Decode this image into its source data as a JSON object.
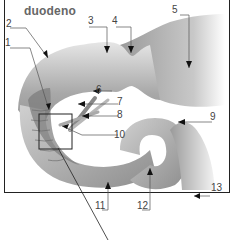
{
  "title": "duodeno",
  "labels": {
    "l1": "1",
    "l2": "2",
    "l3": "3",
    "l4": "4",
    "l5": "5",
    "l6": "6",
    "l7": "7",
    "l8": "8",
    "l9": "9",
    "l10": "10",
    "l11": "11",
    "l12": "12",
    "l13": "13"
  }
}
